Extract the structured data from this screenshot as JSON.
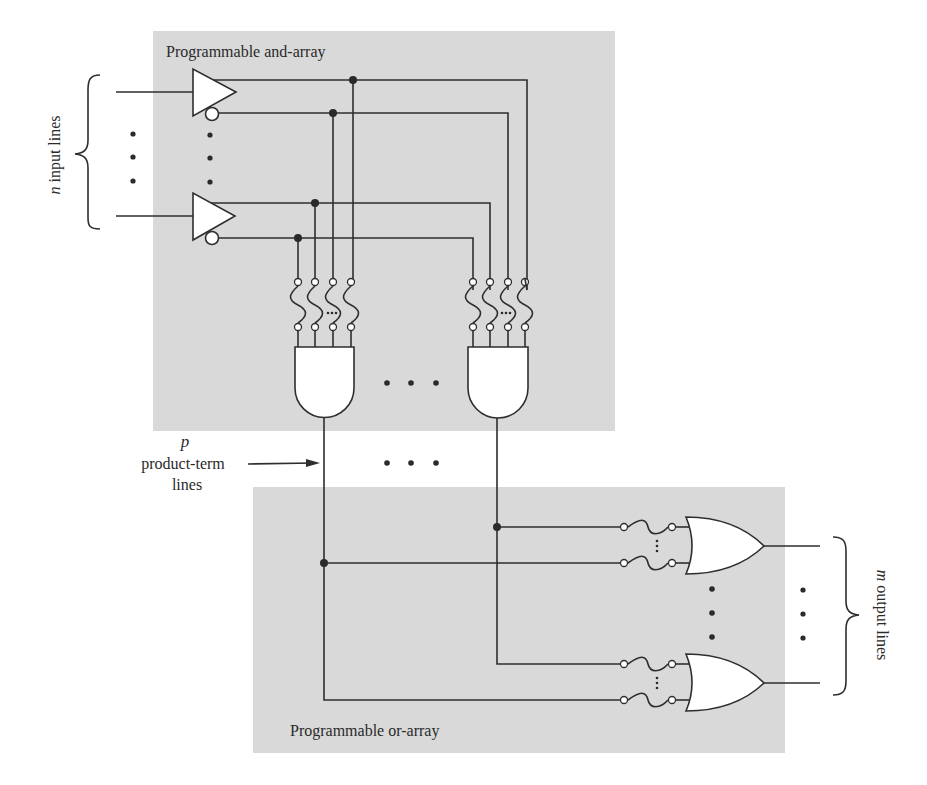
{
  "figure": {
    "colors": {
      "region_fill": "#d8d8d8",
      "line": "#2e2e2e",
      "gate_fill": "#ffffff",
      "background": "#ffffff"
    }
  },
  "labels": {
    "and_array": "Programmable and-array",
    "or_array": "Programmable or-array",
    "inputs_var": "n",
    "inputs_text": " input lines",
    "outputs_var": "m",
    "outputs_text": " output lines",
    "product_var": "p",
    "product_line1": "product-term",
    "product_line2": "lines"
  },
  "components": {
    "input_buffers": [
      {
        "name": "input-buffer-1",
        "has_true_output": true,
        "has_inverted_output": true
      },
      {
        "name": "input-buffer-n",
        "has_true_output": true,
        "has_inverted_output": true
      }
    ],
    "and_gates": [
      {
        "name": "and-gate-1",
        "fused_inputs": 4
      },
      {
        "name": "and-gate-p",
        "fused_inputs": 4
      }
    ],
    "or_gates": [
      {
        "name": "or-gate-1",
        "fused_inputs": 2
      },
      {
        "name": "or-gate-m",
        "fused_inputs": 2
      }
    ],
    "ellipsis": "• • •"
  }
}
